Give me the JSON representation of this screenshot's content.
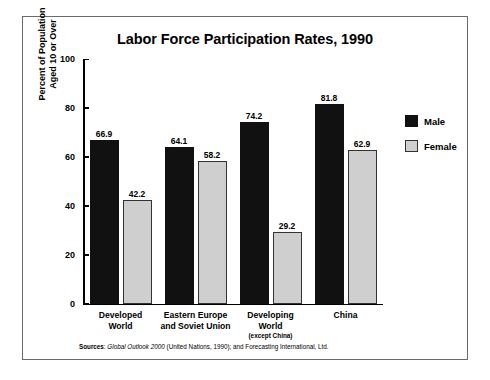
{
  "chart_data": {
    "type": "bar",
    "title": "Labor Force Participation Rates, 1990",
    "xlabel": "",
    "ylabel": "Percent of Population\nAged 10 or Over",
    "ylim": [
      0,
      100
    ],
    "yticks": [
      0,
      20,
      40,
      60,
      80,
      100
    ],
    "ytick_labels": [
      "0",
      "20",
      "40",
      "60",
      "80",
      "100"
    ],
    "grid": false,
    "legend_position": "right",
    "categories": [
      "Developed\nWorld",
      "Eastern Europe\nand Soviet Union",
      "Developing\nWorld",
      "China"
    ],
    "category_parts": [
      {
        "line1": "Developed",
        "line2": "World",
        "note": ""
      },
      {
        "line1": "Eastern Europe",
        "line2": "and Soviet Union",
        "note": ""
      },
      {
        "line1": "Developing",
        "line2": "World",
        "note": "(except China)"
      },
      {
        "line1": "China",
        "line2": "",
        "note": ""
      }
    ],
    "series": [
      {
        "name": "Male",
        "color": "#111111",
        "values": [
          66.9,
          64.1,
          74.2,
          81.8
        ]
      },
      {
        "name": "Female",
        "color": "#cfcfcf",
        "values": [
          42.2,
          58.2,
          29.2,
          62.9
        ]
      }
    ],
    "value_labels": {
      "male": [
        "66.9",
        "64.1",
        "74.2",
        "81.8"
      ],
      "female": [
        "42.2",
        "58.2",
        "29.2",
        "62.9"
      ]
    },
    "source_note": {
      "label": "Sources",
      "separator": ": ",
      "italic_title": "Global Outlook 2000",
      "rest": " (United Nations, 1990); and Forecasting International, Ltd."
    }
  },
  "legend": {
    "items": [
      {
        "label": "Male"
      },
      {
        "label": "Female"
      }
    ]
  }
}
